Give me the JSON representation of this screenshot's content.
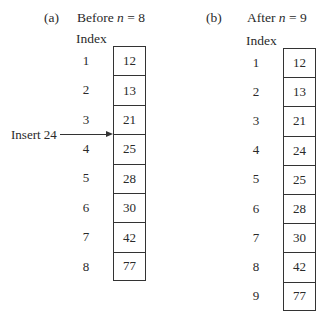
{
  "panel_a": {
    "label": "(a)",
    "caption_prefix": "Before ",
    "caption_var": "n",
    "caption_suffix": " = 8",
    "index_header": "Index",
    "indices": [
      "1",
      "2",
      "3",
      "4",
      "5",
      "6",
      "7",
      "8"
    ],
    "values": [
      "12",
      "13",
      "21",
      "25",
      "28",
      "30",
      "42",
      "77"
    ]
  },
  "panel_b": {
    "label": "(b)",
    "caption_prefix": "After ",
    "caption_var": "n",
    "caption_suffix": " = 9",
    "index_header": "Index",
    "indices": [
      "1",
      "2",
      "3",
      "4",
      "5",
      "6",
      "7",
      "8",
      "9"
    ],
    "values": [
      "12",
      "13",
      "21",
      "24",
      "25",
      "28",
      "30",
      "42",
      "77"
    ]
  },
  "insert": {
    "label": "Insert 24",
    "position_between": [
      "3",
      "4"
    ]
  }
}
